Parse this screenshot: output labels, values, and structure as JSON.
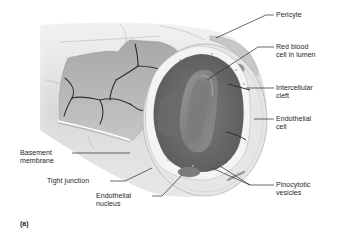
{
  "figure": {
    "panel_label": "(a)",
    "colors": {
      "background": "#ffffff",
      "outer_wall": "#e4e4e4",
      "wall_shadow": "#c8c8c8",
      "inner_surface": "#b0b0b0",
      "lumen": "#6e6e6e",
      "red_blood_cell": "#8a8a8a",
      "cell_borders": "#2e2e2e",
      "nucleus": "#7c7c7c",
      "text": "#1e1e1e",
      "leader_lines": "#2a2a2a"
    }
  },
  "labels": {
    "pericyte": "Pericyte",
    "red_blood_cell": "Red blood\ncell in lumen",
    "intercellular_cleft": "Intercellular\ncleft",
    "endothelial_cell": "Endothelial\ncell",
    "basement_membrane": "Basement\nmembrane",
    "tight_junction": "Tight junction",
    "endothelial_nucleus": "Endothelial\nnucleus",
    "pinocytotic_vesicles": "Pinocytotic\nvesicles"
  }
}
